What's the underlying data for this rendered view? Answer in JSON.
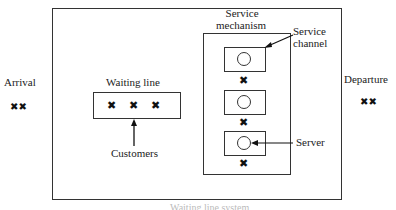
{
  "labels": {
    "arrival": "Arrival",
    "waiting_line": "Waiting line",
    "customers": "Customers",
    "service_mechanism_line1": "Service",
    "service_mechanism_line2": "mechanism",
    "service_channel_line1": "Service",
    "service_channel_line2": "channel",
    "server": "Server",
    "departure": "Departure",
    "caption": "Waiting line system"
  },
  "symbols": {
    "customer": "✖✖",
    "single": "✖"
  }
}
